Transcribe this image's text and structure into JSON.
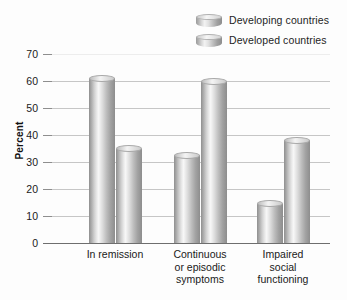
{
  "chart_data": {
    "type": "bar",
    "title": "",
    "subtitle": "",
    "xlabel": "",
    "ylabel": "Percent",
    "ylim": [
      0,
      70
    ],
    "ytick_step": 10,
    "yticks": [
      70,
      60,
      50,
      40,
      30,
      20,
      10,
      0
    ],
    "grid": true,
    "grid_axis": "y",
    "legend_position": "top-right",
    "categories": [
      "In remission",
      "Continuous\nor episodic\nsymptoms",
      "Impaired\nsocial\nfunctioning"
    ],
    "series": [
      {
        "name": "Developing countries",
        "values": [
          61,
          32.5,
          14.5
        ]
      },
      {
        "name": "Developed countries",
        "values": [
          35,
          60,
          38
        ]
      }
    ],
    "bar_style": "cylinder",
    "colors": {
      "bar_light": "#f7f7f7",
      "bar_mid": "#c4c4c4",
      "bar_dark": "#8d8d8d",
      "gridline": "#c6c6c6",
      "axis": "#6e6e6e",
      "background": "#fdfdfd",
      "text": "#1a1a1a"
    }
  },
  "legend": {
    "items": [
      {
        "label": "Developing countries",
        "swatch": "cylinder-swatch"
      },
      {
        "label": "Developed countries",
        "swatch": "cylinder-swatch"
      }
    ]
  },
  "axes": {
    "y_title": "Percent",
    "y_tick_labels": [
      "70",
      "60",
      "50",
      "40",
      "30",
      "20",
      "10",
      "0"
    ]
  }
}
